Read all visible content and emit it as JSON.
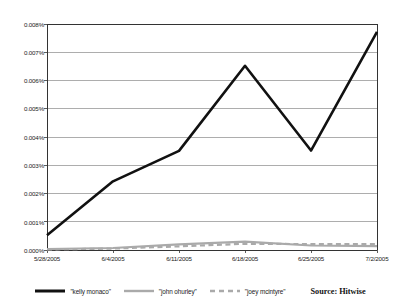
{
  "chart_data": {
    "type": "line",
    "title": "",
    "xlabel": "",
    "ylabel": "",
    "categories": [
      "5/28/2005",
      "6/4/2005",
      "6/11/2005",
      "6/18/2005",
      "6/25/2005",
      "7/2/2005"
    ],
    "x_tick_labels": [
      "5/28/2005",
      "6/4/2005",
      "6/11/2005",
      "6/18/2005",
      "6/25/2005",
      "7/2/2005"
    ],
    "y_tick_labels": [
      "0.000%",
      "0.001%",
      "0.002%",
      "0.003%",
      "0.004%",
      "0.005%",
      "0.006%",
      "0.007%",
      "0.008%"
    ],
    "ylim": [
      0,
      0.008
    ],
    "y_tick_step": 0.001,
    "y_unit": "%",
    "grid": "horizontal",
    "legend_position": "bottom",
    "series": [
      {
        "name": "\"kelly monaco\"",
        "color": "#111111",
        "style": "solid",
        "width": 2.6,
        "values": [
          0.00052,
          0.00243,
          0.00351,
          0.00652,
          0.00352,
          0.00772
        ]
      },
      {
        "name": "\"john ohurley\"",
        "color": "#aaaaaa",
        "style": "solid",
        "width": 2.2,
        "values": [
          3e-05,
          7e-05,
          0.0002,
          0.0003,
          0.00016,
          0.00014
        ]
      },
      {
        "name": "\"joey mcintyre\"",
        "color": "#aaaaaa",
        "style": "dashed",
        "width": 2.2,
        "values": [
          2e-05,
          5e-05,
          0.00013,
          0.00022,
          0.00021,
          0.00021
        ]
      }
    ],
    "annotations": [
      {
        "text": "Source: Hitwise"
      }
    ]
  },
  "legend": {
    "items": [
      {
        "label": "\"kelly monaco\""
      },
      {
        "label": "\"john ohurley\""
      },
      {
        "label": "\"joey mcintyre\""
      }
    ]
  },
  "source": {
    "text": "Source: Hitwise"
  },
  "colors": {
    "series_primary": "#111111",
    "series_secondary": "#aaaaaa",
    "grid": "#999999",
    "axis": "#333333",
    "text": "#1a1a1a",
    "background": "#ffffff"
  }
}
